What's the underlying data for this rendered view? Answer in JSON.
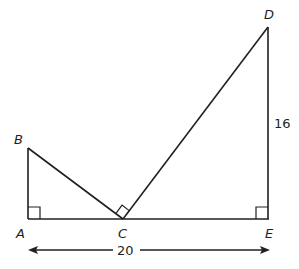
{
  "diagram": {
    "type": "geometry",
    "points": {
      "A": {
        "label": "A",
        "x": 28,
        "y": 219
      },
      "B": {
        "label": "B",
        "x": 28,
        "y": 148
      },
      "C": {
        "label": "C",
        "x": 123,
        "y": 219
      },
      "D": {
        "label": "D",
        "x": 268,
        "y": 27
      },
      "E": {
        "label": "E",
        "x": 268,
        "y": 219
      }
    },
    "segments": [
      "AB",
      "BC",
      "CD",
      "DE",
      "AE"
    ],
    "right_angles": [
      "A",
      "C",
      "E"
    ],
    "measurements": {
      "DE": "16",
      "AE": "20"
    }
  }
}
